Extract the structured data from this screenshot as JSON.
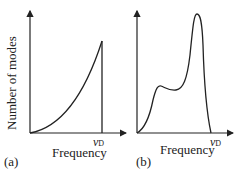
{
  "figure": {
    "y_axis_label": "Number of modes",
    "panels": [
      {
        "tag": "(a)",
        "x_axis_label": "Frequency",
        "cutoff_symbol": "ν",
        "cutoff_subscript": "D"
      },
      {
        "tag": "(b)",
        "x_axis_label": "Frequency",
        "cutoff_symbol": "ν",
        "cutoff_subscript": "D"
      }
    ],
    "line_color": "#222222"
  }
}
